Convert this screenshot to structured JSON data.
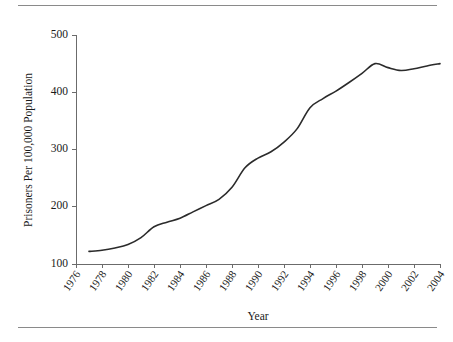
{
  "figure": {
    "has_top_rule": true,
    "has_bottom_rule": true,
    "rule_color": "#8a8a8a",
    "background": "#ffffff"
  },
  "chart_data": {
    "type": "line",
    "title": "",
    "xlabel": "Year",
    "ylabel": "Prisoners Per 100,000 Population",
    "xlim": [
      1976,
      2004
    ],
    "ylim": [
      100,
      500
    ],
    "grid": false,
    "legend": null,
    "line_color": "#2b2b2b",
    "xticks": [
      1976,
      1978,
      1980,
      1982,
      1984,
      1986,
      1988,
      1990,
      1992,
      1994,
      1996,
      1998,
      2000,
      2002,
      2004
    ],
    "xtick_labels": [
      "1976",
      "1978",
      "1980",
      "1982",
      "1984",
      "1986",
      "1988",
      "1990",
      "1992",
      "1994",
      "1996",
      "1998",
      "2000",
      "2002",
      "2004"
    ],
    "yticks": [
      100,
      200,
      300,
      400,
      500
    ],
    "ytick_labels": [
      "100",
      "200",
      "300",
      "400",
      "500"
    ],
    "x": [
      1977,
      1978,
      1979,
      1980,
      1981,
      1982,
      1983,
      1984,
      1985,
      1986,
      1987,
      1988,
      1989,
      1990,
      1991,
      1992,
      1993,
      1994,
      1995,
      1996,
      1997,
      1998,
      1999,
      2000,
      2001,
      2002,
      2003,
      2004
    ],
    "values": [
      122,
      124,
      128,
      134,
      146,
      165,
      173,
      180,
      191,
      202,
      213,
      234,
      268,
      285,
      296,
      313,
      336,
      373,
      389,
      402,
      417,
      433,
      450,
      443,
      438,
      441,
      446,
      450
    ],
    "series": [
      {
        "name": "Prisoners Per 100,000 Population",
        "values": [
          122,
          124,
          128,
          134,
          146,
          165,
          173,
          180,
          191,
          202,
          213,
          234,
          268,
          285,
          296,
          313,
          336,
          373,
          389,
          402,
          417,
          433,
          450,
          443,
          438,
          441,
          446,
          450
        ]
      }
    ]
  }
}
